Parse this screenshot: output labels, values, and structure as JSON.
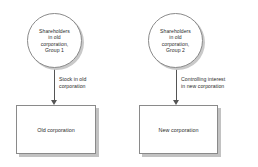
{
  "diagram": {
    "background_color": "#ffffff",
    "shape_outline_color": "#8a8a8a",
    "shadow_color": "#c2c2c2",
    "text_color": "#2b2b2b",
    "arrow_color": "#555555",
    "nodes": {
      "circle_left": {
        "shape": "circle",
        "text": "Shareholders\nin old\ncorporation,\nGroup 1"
      },
      "circle_right": {
        "shape": "circle",
        "text": "Shareholders\nin old\ncorporation,\nGroup 2"
      },
      "box_left": {
        "shape": "rectangle",
        "text": "Old corporation"
      },
      "box_right": {
        "shape": "rectangle",
        "text": "New corporation"
      }
    },
    "edges": {
      "left": {
        "from": "circle_left",
        "to": "box_left",
        "direction": "down",
        "label": "Stock in old\ncorporation"
      },
      "right": {
        "from": "circle_right",
        "to": "box_right",
        "direction": "down",
        "label": "Controlling interest\nin new corporation"
      }
    }
  }
}
